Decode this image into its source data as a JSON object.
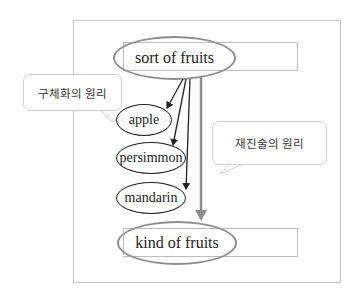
{
  "diagram": {
    "top_node": {
      "label": "sort of fruits"
    },
    "bottom_node": {
      "label": "kind of fruits"
    },
    "children": [
      {
        "label": "apple"
      },
      {
        "label": "persimmon"
      },
      {
        "label": "mandarin"
      }
    ],
    "callouts": {
      "left": {
        "label": "구체화의 원리"
      },
      "right": {
        "label": "재진술의 원리"
      }
    },
    "colors": {
      "gray_arrow": "#8e8e8e",
      "black_arrow": "#222222",
      "frame": "#c4c4c4"
    }
  }
}
